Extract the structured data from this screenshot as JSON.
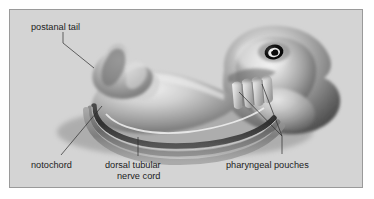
{
  "figure": {
    "panel_background_color": "#d4d4d4",
    "panel_border_color": "#9a9a9a",
    "page_background_color": "#ffffff",
    "style": "grayscale airbrush illustration"
  },
  "labels": {
    "postanal_tail": "postanal tail",
    "notochord": "notochord",
    "nerve_cord_line1": "dorsal tubular",
    "nerve_cord_line2": "nerve cord",
    "pharyngeal_pouches": "pharyngeal pouches"
  },
  "subject": {
    "name": "vertebrate embryo",
    "features": [
      "head with pigmented eye",
      "curved trunk",
      "postanal tail",
      "notochord",
      "dorsal tubular nerve cord",
      "pharyngeal pouches"
    ]
  },
  "colors": {
    "ink": "#1c1c1c",
    "leader": "#2b2b2b",
    "body_light": "#e8e8e8",
    "body_mid": "#9c9c9c",
    "body_dark": "#4a4a4a",
    "body_shadow": "#2e2e2e",
    "eye": "#0d0d0d"
  }
}
